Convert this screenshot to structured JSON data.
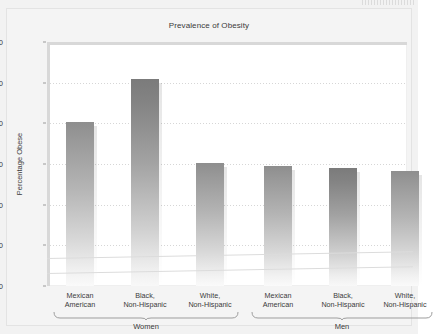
{
  "figure": {
    "background_color": "#f2f2f2",
    "plot_background_color": "#ffffff"
  },
  "chart_data": {
    "type": "bar",
    "title": "Prevalence of Obesity",
    "xlabel": "",
    "ylabel": "Percentage Obese",
    "ylim": [
      0,
      60
    ],
    "yticks": [
      0,
      10,
      20,
      30,
      40,
      50,
      60
    ],
    "grid": true,
    "legend": null,
    "categories": [
      "Mexican American",
      "Black, Non-Hispanic",
      "White, Non-Hispanic",
      "Mexican American",
      "Black, Non-Hispanic",
      "White, Non-Hispanic"
    ],
    "values": [
      40.4,
      50.8,
      30.2,
      29.5,
      28.9,
      28.2
    ],
    "groups": [
      {
        "label": "Women",
        "categories": [
          "Mexican American",
          "Black, Non-Hispanic",
          "White, Non-Hispanic"
        ],
        "values": [
          40.4,
          50.8,
          30.2
        ]
      },
      {
        "label": "Men",
        "categories": [
          "Mexican American",
          "Black, Non-Hispanic",
          "White, Non-Hispanic"
        ],
        "values": [
          29.5,
          28.9,
          28.2
        ]
      }
    ]
  },
  "axis": {
    "y_tick_labels": [
      "60",
      "50",
      "40",
      "30",
      "20",
      "10",
      "0"
    ],
    "y_axis_title": "Percentage Obese"
  },
  "category_labels": [
    {
      "line1": "Mexican",
      "line2": "American"
    },
    {
      "line1": "Black,",
      "line2": "Non-Hispanic"
    },
    {
      "line1": "White,",
      "line2": "Non-Hispanic"
    },
    {
      "line1": "Mexican",
      "line2": "American"
    },
    {
      "line1": "Black,",
      "line2": "Non-Hispanic"
    },
    {
      "line1": "White,",
      "line2": "Non-Hispanic"
    }
  ],
  "group_labels": [
    "Women",
    "Men"
  ]
}
